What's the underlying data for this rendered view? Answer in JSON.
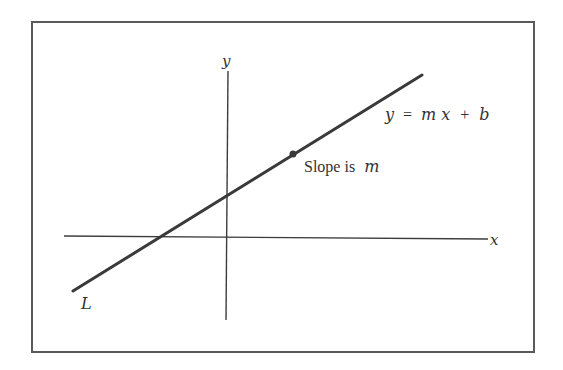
{
  "figure": {
    "type": "coordinate-plane",
    "frame": {
      "x": 32,
      "y": 22,
      "width": 502,
      "height": 330
    },
    "colors": {
      "frame": "#5a5a5a",
      "axes": "#3c3c3c",
      "line": "#3a3a3a",
      "point": "#3a3a3a",
      "text": "#333333"
    },
    "axes": {
      "x": {
        "label": "x",
        "x1": 64,
        "y1": 236,
        "x2": 488,
        "y2": 239
      },
      "y": {
        "label": "y",
        "x1": 228,
        "y1": 71,
        "x2": 226,
        "y2": 320
      }
    },
    "line": {
      "name": "L",
      "label": "L",
      "equation": "y = mx + b",
      "equation_parts": {
        "lhs": "y",
        "eq": "=",
        "m": "m",
        "x": "x",
        "plus": "+",
        "b": "b"
      },
      "x1": 73,
      "y1": 291,
      "x2": 422,
      "y2": 75
    },
    "point": {
      "cx": 293,
      "cy": 154,
      "r": 3.5,
      "annotation_prefix": "Slope is",
      "annotation_var": "m"
    }
  }
}
